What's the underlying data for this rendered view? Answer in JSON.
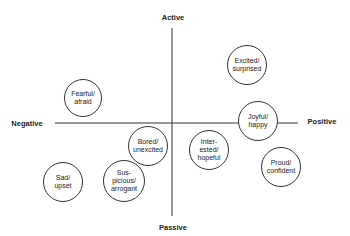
{
  "axes": {
    "top_label": "Active",
    "bottom_label": "Passive",
    "left_label": "Negative",
    "right_label": "Positive"
  },
  "emotions": [
    {
      "label": "Fearful/\nafraid",
      "cx": 83,
      "cy": 98,
      "r": 19
    },
    {
      "label": "Excited/\nsurprised",
      "cx": 247,
      "cy": 65,
      "r": 20
    },
    {
      "label": "Joyful/\nhappy",
      "cx": 258,
      "cy": 121,
      "r": 20
    },
    {
      "label": "Bored/\nunexcited",
      "cx": 148,
      "cy": 146,
      "r": 20
    },
    {
      "label": "Sad/\nupset",
      "cx": 63,
      "cy": 182,
      "r": 20
    },
    {
      "label": "Sus-\npicious/\narrogant",
      "cx": 124,
      "cy": 181,
      "r": 21
    },
    {
      "label": "Inter-\nested/\nhopeful",
      "cx": 209,
      "cy": 150,
      "r": 20
    },
    {
      "label": "Proud/\nconfident",
      "cx": 281,
      "cy": 167,
      "r": 20
    }
  ],
  "colors": {
    "line": "#333333",
    "text": "#222222",
    "background": "#ffffff"
  }
}
